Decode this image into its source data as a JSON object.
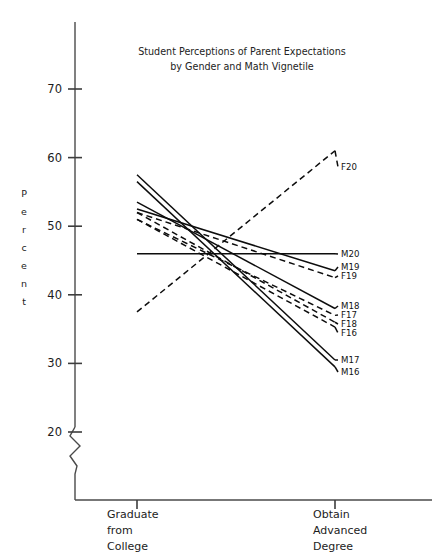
{
  "chart_data": {
    "type": "line",
    "title": "Student Perceptions of Parent Expectations by Gender and Math Vignetile",
    "title_line1": "Student Perceptions of Parent Expectations",
    "title_line2": "by Gender and Math Vignetile",
    "xlabel": "",
    "ylabel": "Percent",
    "ylabel_letters": [
      "P",
      "e",
      "r",
      "c",
      "e",
      "n",
      "t"
    ],
    "categories": [
      "Graduate from College",
      "Obtain Advanced Degree"
    ],
    "category_lines": [
      [
        "Graduate",
        "from",
        "College"
      ],
      [
        "Obtain",
        "Advanced",
        "Degree"
      ]
    ],
    "ylim": [
      20,
      73
    ],
    "yticks": [
      20,
      30,
      40,
      50,
      60,
      70
    ],
    "ytick_labels": [
      "20",
      "30",
      "40",
      "50",
      "60",
      "70"
    ],
    "axis_break": true,
    "axis_break_note": "zigzag break on y-axis below 20",
    "grid": false,
    "legend_position": "right-inline-labels",
    "line_color": "#0d0d0d",
    "series": [
      {
        "name": "F20",
        "gender": "F",
        "style": "dashed",
        "values": [
          37.5,
          61.0
        ],
        "label_y": 170
      },
      {
        "name": "M20",
        "gender": "M",
        "style": "solid",
        "values": [
          46.0,
          46.0
        ],
        "label_y": 257
      },
      {
        "name": "M19",
        "gender": "M",
        "style": "solid",
        "values": [
          52.5,
          43.5
        ],
        "label_y": 270
      },
      {
        "name": "F19",
        "gender": "F",
        "style": "dashed",
        "values": [
          52.0,
          42.5
        ],
        "label_y": 279
      },
      {
        "name": "M18",
        "gender": "M",
        "style": "solid",
        "values": [
          53.5,
          38.0
        ],
        "label_y": 309
      },
      {
        "name": "F17",
        "gender": "F",
        "style": "dashed",
        "values": [
          51.0,
          37.0
        ],
        "label_y": 318
      },
      {
        "name": "F18",
        "gender": "F",
        "style": "dashed",
        "values": [
          52.0,
          36.0
        ],
        "label_y": 327
      },
      {
        "name": "F16",
        "gender": "F",
        "style": "dashed",
        "values": [
          51.0,
          35.3
        ],
        "label_y": 336
      },
      {
        "name": "M17",
        "gender": "M",
        "style": "solid",
        "values": [
          57.5,
          30.5
        ],
        "label_y": 363
      },
      {
        "name": "M16",
        "gender": "M",
        "style": "solid",
        "values": [
          56.5,
          29.5
        ],
        "label_y": 375
      }
    ]
  }
}
